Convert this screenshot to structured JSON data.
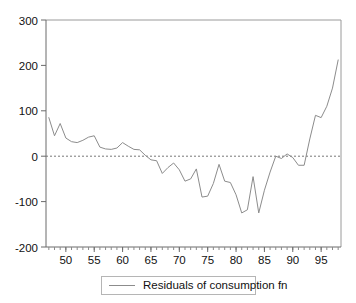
{
  "chart_data": {
    "type": "line",
    "title": "",
    "subtitle": "",
    "xlabel": "",
    "ylabel": "",
    "xlim": [
      1946.5,
      1998.5
    ],
    "ylim": [
      -200,
      300
    ],
    "grid": false,
    "zero_reference_line": true,
    "legend_position": "bottom-center",
    "y_ticks": [
      300,
      200,
      100,
      0,
      -100,
      -200
    ],
    "y_tick_labels": [
      "300",
      "200",
      "100",
      "0",
      "-100",
      "-200"
    ],
    "x_ticks": [
      1950,
      1955,
      1960,
      1965,
      1970,
      1975,
      1980,
      1985,
      1990,
      1995
    ],
    "x_tick_labels": [
      "50",
      "55",
      "60",
      "65",
      "70",
      "75",
      "80",
      "85",
      "90",
      "95"
    ],
    "x_minor_tick_step": 1,
    "series": [
      {
        "name": "Residuals of consumption fn",
        "color": "#8c8c8c",
        "x": [
          1947,
          1948,
          1949,
          1950,
          1951,
          1952,
          1953,
          1954,
          1955,
          1956,
          1957,
          1958,
          1959,
          1960,
          1961,
          1962,
          1963,
          1964,
          1965,
          1966,
          1967,
          1968,
          1969,
          1970,
          1971,
          1972,
          1973,
          1974,
          1975,
          1976,
          1977,
          1978,
          1979,
          1980,
          1981,
          1982,
          1983,
          1984,
          1985,
          1986,
          1987,
          1988,
          1989,
          1990,
          1991,
          1992,
          1993,
          1994,
          1995,
          1996,
          1997,
          1998
        ],
        "values": [
          85,
          45,
          72,
          40,
          32,
          30,
          35,
          42,
          45,
          20,
          16,
          15,
          18,
          30,
          22,
          15,
          14,
          2,
          -8,
          -10,
          -38,
          -25,
          -15,
          -30,
          -55,
          -50,
          -28,
          -90,
          -88,
          -60,
          -18,
          -55,
          -58,
          -85,
          -125,
          -118,
          -45,
          -125,
          -75,
          -35,
          0,
          -5,
          5,
          -3,
          -20,
          -20,
          38,
          90,
          85,
          110,
          150,
          212
        ]
      }
    ]
  },
  "legend": {
    "entries": [
      {
        "label": "Residuals of consumption fn",
        "swatch": "line-swatch"
      }
    ]
  },
  "axes": {
    "y_axis_name": "y-axis",
    "x_axis_name": "x-axis"
  }
}
